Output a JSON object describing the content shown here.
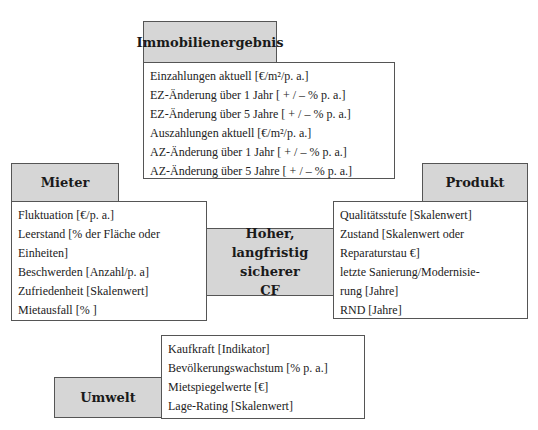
{
  "immobilienergebnis": {
    "title": "Immobilienergebnis",
    "items": [
      "Einzahlungen aktuell [€/m²/p. a.]",
      "EZ-Änderung über 1 Jahr [ + / – % p. a.]",
      "EZ-Änderung über 5 Jahre [ + / – % p. a.]",
      "Auszahlungen aktuell [€/m²/p. a.]",
      "AZ-Änderung über 1 Jahr [ + / – % p. a.]",
      "AZ-Änderung über 5 Jahre [ + / – % p. a.]"
    ]
  },
  "mieter": {
    "title": "Mieter",
    "items": [
      "Fluktuation [€/p. a.]",
      "Leerstand [% der Fläche oder",
      "Einheiten]",
      "Beschwerden [Anzahl/p. a]",
      "Zufriedenheit [Skalenwert]",
      "Mietausfall [% ]"
    ]
  },
  "center": {
    "lines": [
      "Hoher,",
      "langfristig sicherer",
      "CF"
    ]
  },
  "produkt": {
    "title": "Produkt",
    "items": [
      "Qualitätsstufe [Skalenwert]",
      "Zustand [Skalenwert oder",
      "Reparaturstau €]",
      "letzte Sanierung/Modernisie-",
      "rung [Jahre]",
      "RND [Jahre]"
    ]
  },
  "umwelt": {
    "title": "Umwelt",
    "items": [
      "Kaufkraft [Indikator]",
      "Bevölkerungswachstum [% p. a.]",
      "Mietspiegelwerte [€]",
      "Lage-Rating [Skalenwert]"
    ]
  }
}
